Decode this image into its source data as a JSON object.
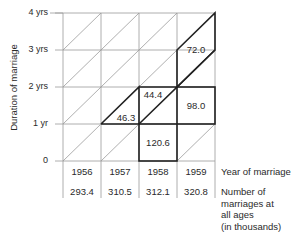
{
  "axis": {
    "y_label": "Duration of marriage",
    "y_ticks": [
      "4 yrs",
      "3 yrs",
      "2 yrs",
      "1 yr",
      "0"
    ]
  },
  "cells": [
    {
      "id": "1957-diag-lower",
      "value": "46.3"
    },
    {
      "id": "1958-diag-upper",
      "value": "44.4"
    },
    {
      "id": "1958-0-1",
      "value": "120.6"
    },
    {
      "id": "1959-1-2",
      "value": "98.0"
    },
    {
      "id": "1959-diag-2-4",
      "value": "72.0"
    }
  ],
  "years": [
    "1956",
    "1957",
    "1958",
    "1959"
  ],
  "totals": [
    "293.4",
    "310.5",
    "312.1",
    "320.8"
  ],
  "row_labels": {
    "year": "Year of marriage",
    "number": [
      "Number of",
      "marriages at",
      "all ages",
      "(in thousands)"
    ]
  }
}
